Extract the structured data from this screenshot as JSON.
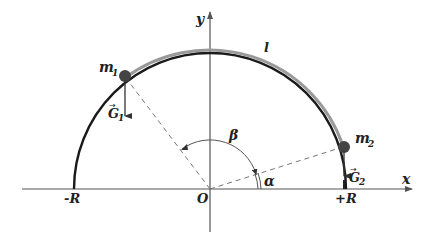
{
  "diagram": {
    "axes": {
      "x_label": "x",
      "y_label": "y",
      "origin_label": "O",
      "neg_r_label": "-R",
      "pos_r_label": "+R"
    },
    "rope_label": "l",
    "mass1": {
      "label": "m",
      "sub": "1",
      "force_label": "G",
      "force_sub": "1"
    },
    "mass2": {
      "label": "m",
      "sub": "2",
      "force_label": "G",
      "force_sub": "2"
    },
    "angles": {
      "alpha": "α",
      "beta": "β"
    },
    "colors": {
      "arc": "#1a1a1a",
      "rope": "#9a9a9a",
      "bead": "#444444",
      "axis": "#555555",
      "dash": "#777777"
    }
  }
}
